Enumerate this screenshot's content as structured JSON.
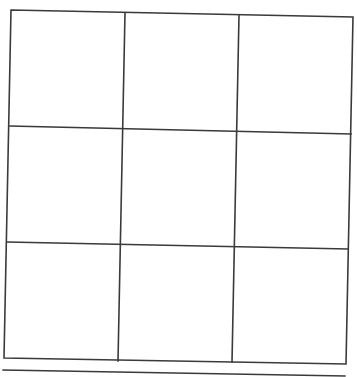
{
  "board": {
    "rows": 3,
    "cols": 3,
    "line_color": "#3a3a3a",
    "background": "#ffffff",
    "cells": [
      [
        "",
        "",
        ""
      ],
      [
        "",
        "",
        ""
      ],
      [
        "",
        "",
        ""
      ]
    ]
  }
}
